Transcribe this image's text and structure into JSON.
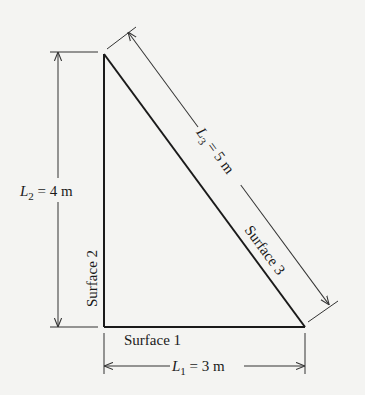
{
  "diagram": {
    "type": "right-triangle-enclosure",
    "colors": {
      "background": "#f4f4f2",
      "line": "#1a1a1a",
      "dim": "#333333"
    },
    "vertices": {
      "top": [
        104,
        54
      ],
      "bottom_left": [
        104,
        327
      ],
      "bottom_right": [
        305,
        327
      ]
    },
    "surfaces": {
      "s1": "Surface 1",
      "s2": "Surface 2",
      "s3": "Surface 3"
    },
    "dimensions": {
      "l1": {
        "var": "L",
        "sub": "1",
        "value": " = 3 m"
      },
      "l2": {
        "var": "L",
        "sub": "2",
        "value": " = 4 m"
      },
      "l3": {
        "var": "L",
        "sub": "3",
        "value": " = 5 m"
      }
    }
  }
}
